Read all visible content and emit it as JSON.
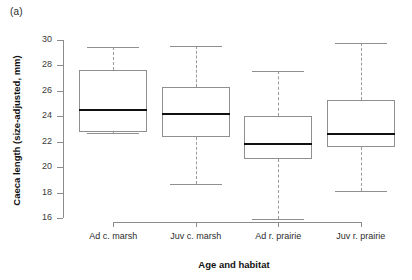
{
  "figure": {
    "panel_label": "(a)",
    "xlabel": "Age and habitat",
    "ylabel": "Caeca length (size-adjusted, mm)"
  },
  "chart_data": {
    "type": "box",
    "title": "(a)",
    "xlabel": "Age and habitat",
    "ylabel": "Caeca length (size-adjusted, mm)",
    "ylim": [
      15.4,
      30.3
    ],
    "yticks": [
      16,
      18,
      20,
      22,
      24,
      26,
      28,
      30
    ],
    "ytick_labels": [
      "16",
      "18",
      "20",
      "22",
      "24",
      "26",
      "28",
      "30"
    ],
    "grid": false,
    "legend": null,
    "categories": [
      "Ad c. marsh",
      "Juv c. marsh",
      "Ad r. prairie",
      "Juv r. prairie"
    ],
    "boxes": [
      {
        "category": "Ad c. marsh",
        "whisker_low": 22.65,
        "q1": 22.8,
        "median": 24.5,
        "q3": 27.65,
        "whisker_high": 29.45
      },
      {
        "category": "Juv c. marsh",
        "whisker_low": 18.7,
        "q1": 22.4,
        "median": 24.15,
        "q3": 26.3,
        "whisker_high": 29.55
      },
      {
        "category": "Ad r. prairie",
        "whisker_low": 15.95,
        "q1": 20.65,
        "median": 21.8,
        "q3": 24.0,
        "whisker_high": 27.6
      },
      {
        "category": "Juv r. prairie",
        "whisker_low": 18.1,
        "q1": 21.55,
        "median": 22.6,
        "q3": 25.3,
        "whisker_high": 29.75
      }
    ],
    "colors": {
      "box_edge": "#8f8f8f",
      "median": "#101010",
      "whisker": "#9a9a9a",
      "axis": "#8c8c8c",
      "background": "#ffffff"
    }
  }
}
